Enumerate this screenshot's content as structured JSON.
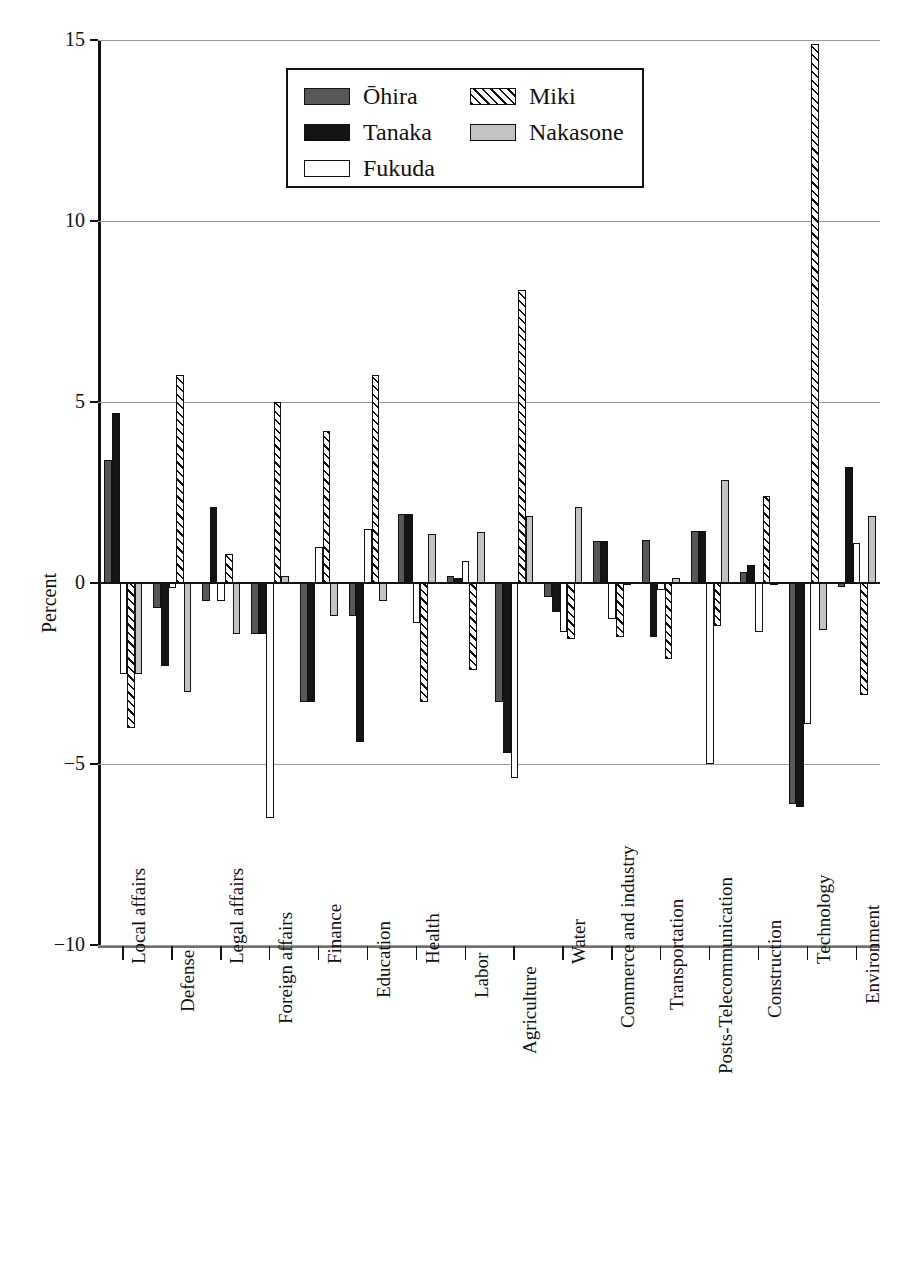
{
  "chart_data": {
    "type": "bar",
    "title": "",
    "xlabel": "",
    "ylabel": "Percent",
    "ylim": [
      -10,
      15
    ],
    "yticks": [
      "15",
      "10",
      "5",
      "0",
      "−5",
      "−10"
    ],
    "ytick_values": [
      15,
      10,
      5,
      0,
      -5,
      -10
    ],
    "grid": true,
    "legend_position": "top-center",
    "categories": [
      "Local affairs",
      "Defense",
      "Legal affairs",
      "Foreign affairs",
      "Finance",
      "Education",
      "Health",
      "Labor",
      "Agriculture",
      "Water",
      "Commerce and industry",
      "Transportation",
      "Posts-Telecommunication",
      "Construction",
      "Technology",
      "Environment"
    ],
    "series": [
      {
        "name": "Ōhira",
        "color": "#575757",
        "pattern": "solid-dark-gray",
        "values": [
          3.4,
          -0.7,
          -0.5,
          -1.4,
          -3.3,
          -0.9,
          1.9,
          0.2,
          -3.3,
          -0.4,
          1.15,
          1.2,
          1.45,
          0.3,
          -6.1,
          -0.1
        ]
      },
      {
        "name": "Tanaka",
        "color": "#141414",
        "pattern": "solid-black",
        "values": [
          4.7,
          -2.3,
          2.1,
          -1.4,
          -3.3,
          -4.4,
          1.9,
          0.15,
          -4.7,
          -0.8,
          1.15,
          -1.5,
          1.45,
          0.5,
          -6.2,
          3.2
        ]
      },
      {
        "name": "Fukuda",
        "color": "#ffffff",
        "pattern": "white-outline",
        "values": [
          -2.5,
          -0.15,
          -0.5,
          -6.5,
          1.0,
          1.5,
          -1.1,
          0.6,
          -5.4,
          -1.35,
          -1.0,
          -0.2,
          -5.0,
          -1.35,
          -3.9,
          1.1
        ]
      },
      {
        "name": "Miki",
        "color": "#ffffff",
        "pattern": "diagonal-hatch",
        "values": [
          -4.0,
          5.75,
          0.8,
          5.0,
          4.2,
          5.75,
          -3.3,
          -2.4,
          8.1,
          -1.55,
          -1.5,
          -2.1,
          -1.2,
          2.4,
          14.9,
          -3.1
        ]
      },
      {
        "name": "Nakasone",
        "color": "#c3c3c3",
        "pattern": "solid-light-gray",
        "values": [
          -2.5,
          -3.0,
          -1.4,
          0.2,
          -0.9,
          -0.5,
          1.35,
          1.4,
          1.85,
          2.1,
          0.0,
          0.15,
          2.85,
          -0.05,
          -1.3,
          1.85
        ]
      }
    ]
  },
  "legend": {
    "items": [
      {
        "label": "Ōhira",
        "style": "s-ohira"
      },
      {
        "label": "Tanaka",
        "style": "s-tanaka"
      },
      {
        "label": "Fukuda",
        "style": "s-fukuda"
      },
      {
        "label": "Miki",
        "style": "s-miki"
      },
      {
        "label": "Nakasone",
        "style": "s-nakasone"
      }
    ]
  },
  "axis": {
    "y_title": "Percent"
  }
}
